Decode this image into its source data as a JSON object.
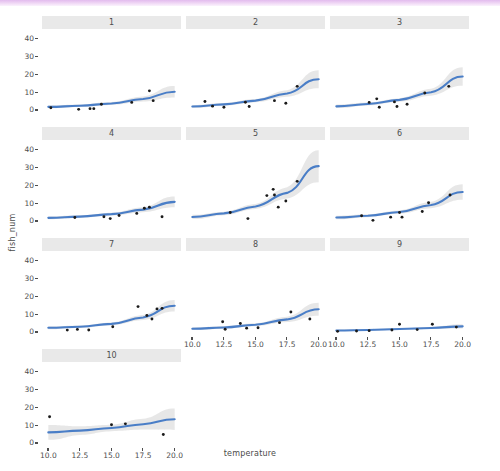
{
  "figure": {
    "xlabel": "temperature",
    "ylabel": "fish_num",
    "caption": "",
    "line_color": "#4a7ec7",
    "ribbon_color": "#d9d9d9",
    "point_color": "#1a1a1a",
    "strip_color": "#e9e9e9",
    "panel_color": "#ffffff",
    "top_band_color": "#e2bbee"
  },
  "axes": {
    "y_ticks": [
      "0",
      "10",
      "20",
      "30",
      "40"
    ],
    "y_values": [
      0,
      10,
      20,
      30,
      40
    ],
    "x_ticks": [
      "10.0",
      "12.5",
      "15.0",
      "17.5",
      "20.0"
    ],
    "x_values": [
      10.0,
      12.5,
      15.0,
      17.5,
      20.0
    ],
    "xlim": [
      9.5,
      20.5
    ],
    "ylim": [
      -2,
      44
    ]
  },
  "chart_data": {
    "type": "scatter",
    "title": "",
    "xlabel": "temperature",
    "ylabel": "fish_num",
    "xlim": [
      9.5,
      20.5
    ],
    "ylim": [
      -2,
      44
    ],
    "grid": false,
    "legend": "none",
    "facet_variable": "id",
    "facet_layout": "3 columns x 4 rows (10 panels)",
    "overlays": [
      "points",
      "fitted-curve",
      "confidence-ribbon"
    ],
    "panels": [
      {
        "label": "1",
        "points": [
          {
            "x": 10.2,
            "y": 1.5
          },
          {
            "x": 12.4,
            "y": 0.6
          },
          {
            "x": 13.3,
            "y": 1.0
          },
          {
            "x": 13.6,
            "y": 1.0
          },
          {
            "x": 14.2,
            "y": 3.5
          },
          {
            "x": 16.6,
            "y": 4.5
          },
          {
            "x": 18.0,
            "y": 11.0
          },
          {
            "x": 18.3,
            "y": 5.5
          }
        ],
        "fit": [
          {
            "x": 10.0,
            "y": 2.0
          },
          {
            "x": 12.5,
            "y": 2.6
          },
          {
            "x": 15.0,
            "y": 3.9
          },
          {
            "x": 17.5,
            "y": 6.4
          },
          {
            "x": 20.0,
            "y": 10.5
          }
        ],
        "ribbon_halfwidth": [
          0.8,
          0.7,
          0.8,
          1.4,
          3.2
        ]
      },
      {
        "label": "2",
        "points": [
          {
            "x": 11.0,
            "y": 5.0
          },
          {
            "x": 11.6,
            "y": 2.4
          },
          {
            "x": 12.5,
            "y": 1.8
          },
          {
            "x": 14.2,
            "y": 4.6
          },
          {
            "x": 14.5,
            "y": 2.2
          },
          {
            "x": 16.5,
            "y": 5.5
          },
          {
            "x": 17.4,
            "y": 4.0
          },
          {
            "x": 18.3,
            "y": 13.5
          }
        ],
        "fit": [
          {
            "x": 10.0,
            "y": 2.2
          },
          {
            "x": 12.5,
            "y": 3.4
          },
          {
            "x": 15.0,
            "y": 5.5
          },
          {
            "x": 17.5,
            "y": 9.5
          },
          {
            "x": 20.0,
            "y": 17.5
          }
        ],
        "ribbon_halfwidth": [
          0.9,
          0.8,
          0.9,
          1.8,
          5.0
        ]
      },
      {
        "label": "3",
        "points": [
          {
            "x": 12.6,
            "y": 4.5
          },
          {
            "x": 13.2,
            "y": 6.5
          },
          {
            "x": 13.4,
            "y": 1.8
          },
          {
            "x": 14.6,
            "y": 4.8
          },
          {
            "x": 14.8,
            "y": 2.2
          },
          {
            "x": 15.6,
            "y": 3.5
          },
          {
            "x": 17.0,
            "y": 9.8
          },
          {
            "x": 18.9,
            "y": 13.5
          }
        ],
        "fit": [
          {
            "x": 10.0,
            "y": 2.3
          },
          {
            "x": 12.5,
            "y": 3.6
          },
          {
            "x": 15.0,
            "y": 5.9
          },
          {
            "x": 17.5,
            "y": 10.2
          },
          {
            "x": 20.0,
            "y": 19.0
          }
        ],
        "ribbon_halfwidth": [
          1.0,
          0.8,
          1.0,
          1.9,
          5.2
        ]
      },
      {
        "label": "4",
        "points": [
          {
            "x": 12.1,
            "y": 2.2
          },
          {
            "x": 14.4,
            "y": 2.6
          },
          {
            "x": 14.9,
            "y": 1.6
          },
          {
            "x": 15.6,
            "y": 3.3
          },
          {
            "x": 17.0,
            "y": 4.5
          },
          {
            "x": 17.6,
            "y": 7.4
          },
          {
            "x": 18.0,
            "y": 8.0
          },
          {
            "x": 19.0,
            "y": 2.6
          }
        ],
        "fit": [
          {
            "x": 10.0,
            "y": 2.0
          },
          {
            "x": 12.5,
            "y": 2.7
          },
          {
            "x": 15.0,
            "y": 4.1
          },
          {
            "x": 17.5,
            "y": 6.6
          },
          {
            "x": 20.0,
            "y": 11.0
          }
        ],
        "ribbon_halfwidth": [
          0.8,
          0.7,
          0.8,
          1.4,
          3.0
        ]
      },
      {
        "label": "5",
        "points": [
          {
            "x": 13.0,
            "y": 5.0
          },
          {
            "x": 14.4,
            "y": 1.6
          },
          {
            "x": 15.9,
            "y": 14.5
          },
          {
            "x": 16.4,
            "y": 18.0
          },
          {
            "x": 16.5,
            "y": 14.8
          },
          {
            "x": 16.8,
            "y": 8.0
          },
          {
            "x": 17.4,
            "y": 11.5
          },
          {
            "x": 18.3,
            "y": 22.5
          }
        ],
        "fit": [
          {
            "x": 10.0,
            "y": 2.5
          },
          {
            "x": 12.5,
            "y": 4.5
          },
          {
            "x": 15.0,
            "y": 8.4
          },
          {
            "x": 17.5,
            "y": 16.0
          },
          {
            "x": 20.0,
            "y": 31.0
          }
        ],
        "ribbon_halfwidth": [
          1.2,
          1.0,
          1.4,
          3.2,
          9.0
        ]
      },
      {
        "label": "6",
        "points": [
          {
            "x": 12.0,
            "y": 3.2
          },
          {
            "x": 12.9,
            "y": 0.6
          },
          {
            "x": 14.3,
            "y": 2.4
          },
          {
            "x": 15.0,
            "y": 5.0
          },
          {
            "x": 15.2,
            "y": 2.4
          },
          {
            "x": 16.8,
            "y": 5.6
          },
          {
            "x": 17.3,
            "y": 10.5
          },
          {
            "x": 19.0,
            "y": 14.8
          }
        ],
        "fit": [
          {
            "x": 10.0,
            "y": 2.2
          },
          {
            "x": 12.5,
            "y": 3.2
          },
          {
            "x": 15.0,
            "y": 5.3
          },
          {
            "x": 17.5,
            "y": 9.2
          },
          {
            "x": 20.0,
            "y": 16.5
          }
        ],
        "ribbon_halfwidth": [
          1.0,
          0.8,
          0.9,
          1.8,
          4.4
        ]
      },
      {
        "label": "7",
        "points": [
          {
            "x": 11.5,
            "y": 1.3
          },
          {
            "x": 12.3,
            "y": 1.7
          },
          {
            "x": 13.2,
            "y": 1.4
          },
          {
            "x": 15.1,
            "y": 3.2
          },
          {
            "x": 17.1,
            "y": 14.5
          },
          {
            "x": 17.8,
            "y": 9.5
          },
          {
            "x": 18.2,
            "y": 7.5
          },
          {
            "x": 18.6,
            "y": 13.2
          },
          {
            "x": 19.0,
            "y": 13.5
          }
        ],
        "fit": [
          {
            "x": 10.0,
            "y": 2.6
          },
          {
            "x": 12.5,
            "y": 3.2
          },
          {
            "x": 15.0,
            "y": 4.8
          },
          {
            "x": 17.5,
            "y": 8.4
          },
          {
            "x": 20.0,
            "y": 15.0
          }
        ],
        "ribbon_halfwidth": [
          0.8,
          0.7,
          0.8,
          1.4,
          3.2
        ]
      },
      {
        "label": "8",
        "points": [
          {
            "x": 12.4,
            "y": 6.0
          },
          {
            "x": 12.6,
            "y": 1.8
          },
          {
            "x": 13.8,
            "y": 5.0
          },
          {
            "x": 14.3,
            "y": 2.4
          },
          {
            "x": 15.2,
            "y": 2.6
          },
          {
            "x": 16.9,
            "y": 5.5
          },
          {
            "x": 17.8,
            "y": 11.5
          },
          {
            "x": 19.3,
            "y": 7.5
          }
        ],
        "fit": [
          {
            "x": 10.0,
            "y": 2.1
          },
          {
            "x": 12.5,
            "y": 2.8
          },
          {
            "x": 15.0,
            "y": 4.3
          },
          {
            "x": 17.5,
            "y": 7.3
          },
          {
            "x": 20.0,
            "y": 13.0
          }
        ],
        "ribbon_halfwidth": [
          0.8,
          0.7,
          0.8,
          1.5,
          3.6
        ]
      },
      {
        "label": "9",
        "points": [
          {
            "x": 10.1,
            "y": 0.6
          },
          {
            "x": 11.6,
            "y": 0.8
          },
          {
            "x": 12.6,
            "y": 1.0
          },
          {
            "x": 14.4,
            "y": 1.4
          },
          {
            "x": 15.0,
            "y": 4.6
          },
          {
            "x": 16.4,
            "y": 1.6
          },
          {
            "x": 17.6,
            "y": 4.6
          },
          {
            "x": 19.5,
            "y": 3.0
          }
        ],
        "fit": [
          {
            "x": 10.0,
            "y": 1.1
          },
          {
            "x": 12.5,
            "y": 1.4
          },
          {
            "x": 15.0,
            "y": 1.9
          },
          {
            "x": 17.5,
            "y": 2.5
          },
          {
            "x": 20.0,
            "y": 3.4
          }
        ],
        "ribbon_halfwidth": [
          0.5,
          0.4,
          0.4,
          0.6,
          1.2
        ]
      },
      {
        "label": "10",
        "points": [
          {
            "x": 10.1,
            "y": 15.0
          },
          {
            "x": 15.0,
            "y": 10.5
          },
          {
            "x": 16.1,
            "y": 11.0
          },
          {
            "x": 19.1,
            "y": 5.0
          }
        ],
        "fit": [
          {
            "x": 10.0,
            "y": 6.2
          },
          {
            "x": 12.5,
            "y": 7.2
          },
          {
            "x": 15.0,
            "y": 8.7
          },
          {
            "x": 17.5,
            "y": 10.8
          },
          {
            "x": 20.0,
            "y": 13.6
          }
        ],
        "ribbon_halfwidth": [
          4.2,
          2.4,
          1.8,
          3.0,
          6.0
        ]
      }
    ]
  }
}
